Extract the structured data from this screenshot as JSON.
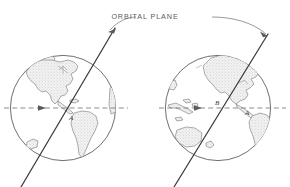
{
  "figure": {
    "title_label": "ORBITAL PLANE",
    "type": "technical-line-diagram",
    "background_color": "#ffffff",
    "ink_color": "#3c3c3c",
    "land_fill_color": "#e8e8e8",
    "land_outline_color": "#6a6a6a",
    "equator_color": "#7a7a7a",
    "leader_color": "#6f6f6f",
    "width": 290,
    "height": 187
  },
  "annotation": {
    "label": "ORBITAL PLANE",
    "leader_left": "curved-leader-to-left-orbit-line",
    "leader_right": "curved-leader-to-right-orbit-line",
    "arrowhead_count": 2
  },
  "globes": [
    {
      "id": "left-globe",
      "name": "earth-globe-left",
      "center_x": 63,
      "center_y": 108,
      "radius": 53,
      "view": "Atlantic / Americas hemisphere",
      "equator": {
        "label": "equator",
        "style": "dashed",
        "direction_arrow": "east",
        "arrow_x": 45
      },
      "point_labels": [
        {
          "text": "A",
          "x": 70,
          "y": 118
        }
      ],
      "landmasses": [
        "North America",
        "South America",
        "Greenland",
        "Africa west coast",
        "southern landmass"
      ],
      "orbit_line": {
        "top_x": 115,
        "top_y": 28,
        "bottom_x": 21,
        "bottom_y": 187,
        "inclination_note": "inclined plane crossing equator at point A"
      }
    },
    {
      "id": "right-globe",
      "name": "earth-globe-right",
      "center_x": 218,
      "center_y": 108,
      "radius": 53,
      "view": "Pacific hemisphere",
      "equator": {
        "label": "equator",
        "style": "dashed",
        "direction_arrow": "east",
        "arrow_x": 200
      },
      "point_labels": [
        {
          "text": "B",
          "x": 218,
          "y": 104
        },
        {
          "text": "A",
          "x": 247,
          "y": 113
        }
      ],
      "landmasses": [
        "North America",
        "South America",
        "Australia",
        "Indonesia islands",
        "New Zealand",
        "Asia east edge"
      ],
      "orbit_line": {
        "top_x": 268,
        "top_y": 34,
        "bottom_x": 174,
        "bottom_y": 187,
        "inclination_note": "inclined plane crossing equator at point B"
      }
    }
  ]
}
